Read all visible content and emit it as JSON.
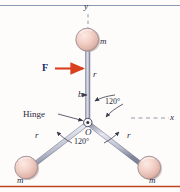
{
  "figure": {
    "colors": {
      "background": "#fdfcfb",
      "rod": "#8b8fa6",
      "rod_light": "#d4d6e0",
      "sphere_fill": "#f2cfc6",
      "sphere_edge": "#9b8f96",
      "force_arrow": "#d9411e",
      "label": "#2a2a3c",
      "force_label": "#202a6b",
      "top_rule": "#8d96b5",
      "bottom_rule": "#c0441f"
    },
    "axes": {
      "y_label": "y",
      "x_label": "x",
      "style": "dashed"
    },
    "masses": [
      {
        "id": "top",
        "label": "m",
        "position": "top"
      },
      {
        "id": "bottom-left",
        "label": "m",
        "position": "bottom-left"
      },
      {
        "id": "bottom-right",
        "label": "m",
        "position": "bottom-right"
      }
    ],
    "rods": [
      {
        "id": "vertical",
        "label": "r"
      },
      {
        "id": "lower-left",
        "label": "r"
      },
      {
        "id": "lower-right",
        "label": "r"
      }
    ],
    "force": {
      "label": "F",
      "direction": "right"
    },
    "distance_marker": {
      "label": "b"
    },
    "hinge": {
      "label": "Hinge",
      "origin_label": "O"
    },
    "angles": [
      {
        "id": "upper",
        "label": "120°"
      },
      {
        "id": "lower",
        "label": "120°"
      }
    ]
  }
}
